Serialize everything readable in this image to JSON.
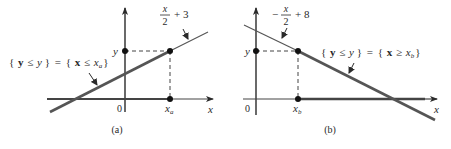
{
  "panels": [
    {
      "id": "a",
      "caption": "(a)",
      "equation": {
        "numerator": "x",
        "denominator": "2",
        "prefix": "",
        "suffix": "+ 3"
      },
      "set_label": {
        "left_open": "{",
        "left_var": "y",
        "op1": "≤",
        "left_val": "y",
        "close1": "}",
        "eq": "=",
        "right_open": "{",
        "right_var": "x",
        "op2": "≤",
        "right_val": "x",
        "right_sub": "a",
        "close2": "}"
      },
      "axis_labels": {
        "x": "x",
        "y": "y",
        "origin": "0",
        "x_point": "x",
        "x_point_sub": "a"
      }
    },
    {
      "id": "b",
      "caption": "(b)",
      "equation": {
        "numerator": "x",
        "denominator": "2",
        "prefix": "−",
        "suffix": "+ 8"
      },
      "set_label": {
        "left_open": "{",
        "left_var": "y",
        "op1": "≤",
        "left_val": "y",
        "close1": "}",
        "eq": "=",
        "right_open": "{",
        "right_var": "x",
        "op2": "≥",
        "right_val": "x",
        "right_sub": "b",
        "close2": "}"
      },
      "axis_labels": {
        "x": "x",
        "y": "y",
        "origin": "0",
        "x_point": "x",
        "x_point_sub": "b"
      }
    }
  ],
  "colors": {
    "ink": "#2a2a2a",
    "line": "#555555",
    "background": "#ffffff"
  }
}
